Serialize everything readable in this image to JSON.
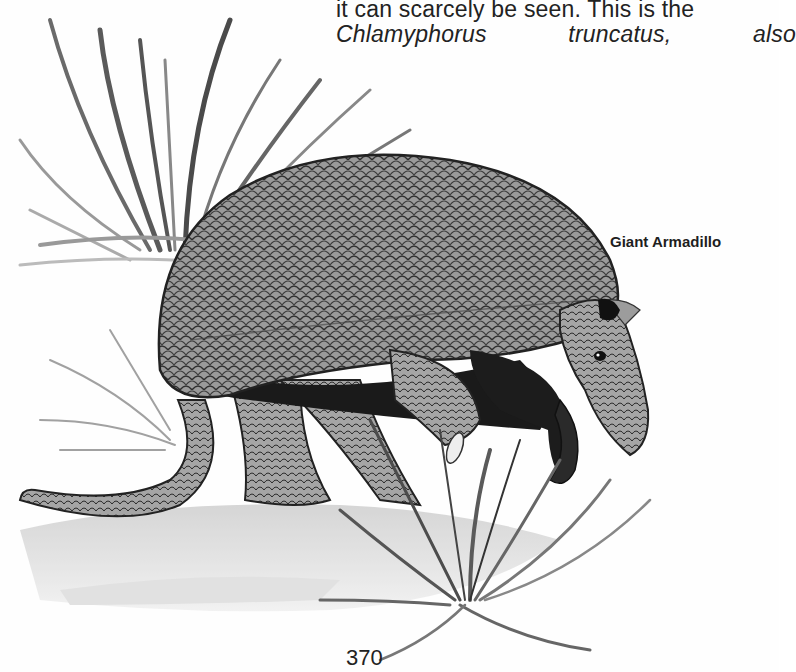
{
  "page": {
    "body_text": {
      "line1": "it can scarcely be seen. This is the",
      "line2": {
        "word1": "Chlamyphorus",
        "word2": "truncatus,",
        "word3": "also"
      }
    },
    "figure": {
      "caption": "Giant Armadillo",
      "subject": "giant-armadillo-illustration"
    },
    "page_number": "370"
  },
  "colors": {
    "paper": "#fefefe",
    "ink": "#222222",
    "shell_mid": "#8a8a8a",
    "shell_dark": "#3a3a3a",
    "grass": "#6e6e6e"
  }
}
